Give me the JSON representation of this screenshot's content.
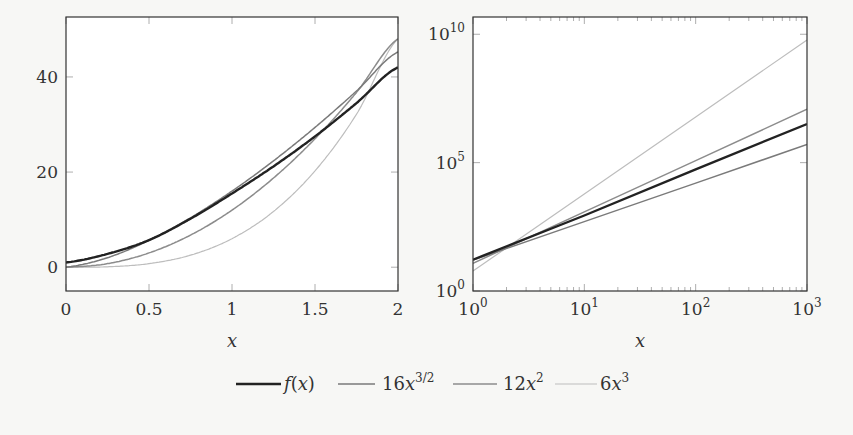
{
  "legend": {
    "entries": [
      {
        "label": "f(x)",
        "label_main": "f",
        "label_rest": "(x)",
        "color": "#222222",
        "width": 2.4
      },
      {
        "label": "16x^{3/2}",
        "coef": "16",
        "var": "x",
        "sup": "3/2",
        "color": "#7a7a7a",
        "width": 1.5
      },
      {
        "label": "12x^2",
        "coef": "12",
        "var": "x",
        "sup": "2",
        "color": "#8c8c8c",
        "width": 1.5
      },
      {
        "label": "6x^3",
        "coef": "6",
        "var": "x",
        "sup": "3",
        "color": "#bdbdbd",
        "width": 1.2
      }
    ]
  },
  "chart_data": [
    {
      "type": "line",
      "title": "",
      "xlabel": "x",
      "ylabel": "",
      "xscale": "linear",
      "yscale": "linear",
      "xlim": [
        0,
        2
      ],
      "ylim": [
        -5,
        52.6
      ],
      "xticks": [
        0,
        0.5,
        1,
        1.5,
        2
      ],
      "xtick_labels": [
        "0",
        "0.5",
        "1",
        "1.5",
        "2"
      ],
      "yticks": [
        0,
        20,
        40
      ],
      "ytick_labels": [
        "0",
        "20",
        "40"
      ],
      "grid": false,
      "legend_position": "bottom-center (shared)",
      "series": [
        {
          "name": "f(x)",
          "x": [
            0,
            0.25,
            0.5,
            0.75,
            1,
            1.25,
            1.5,
            1.75,
            2
          ],
          "values": [
            1,
            2.8,
            5.7,
            10.2,
            15.5,
            21.2,
            27.5,
            34.5,
            42
          ]
        },
        {
          "name": "16x^{3/2}",
          "x": [
            0,
            0.25,
            0.5,
            0.75,
            1,
            1.25,
            1.5,
            1.75,
            2
          ],
          "values": [
            0,
            2,
            5.66,
            10.39,
            16,
            22.36,
            29.39,
            37.04,
            45.25
          ]
        },
        {
          "name": "12x^2",
          "x": [
            0,
            0.25,
            0.5,
            0.75,
            1,
            1.25,
            1.5,
            1.75,
            2
          ],
          "values": [
            0,
            0.75,
            3,
            6.75,
            12,
            18.75,
            27,
            36.75,
            48
          ]
        },
        {
          "name": "6x^3",
          "x": [
            0,
            0.25,
            0.5,
            0.75,
            1,
            1.25,
            1.5,
            1.75,
            2
          ],
          "values": [
            0,
            0.09,
            0.75,
            2.53,
            6,
            11.72,
            20.25,
            32.16,
            48
          ]
        }
      ]
    },
    {
      "type": "line",
      "title": "",
      "xlabel": "x",
      "ylabel": "",
      "xscale": "log",
      "yscale": "log",
      "xlim": [
        1,
        1000
      ],
      "ylim": [
        1,
        47000000000.0
      ],
      "xticks": [
        1,
        10,
        100,
        1000
      ],
      "xtick_labels": [
        "10^0",
        "10^1",
        "10^2",
        "10^3"
      ],
      "yticks": [
        1,
        100000,
        10000000000
      ],
      "ytick_labels": [
        "10^0",
        "10^5",
        "10^10"
      ],
      "grid": false,
      "series": [
        {
          "name": "f(x)",
          "x": [
            1,
            10,
            100,
            1000
          ],
          "values": [
            16.5,
            870,
            55000,
            3200000
          ]
        },
        {
          "name": "16x^{3/2}",
          "x": [
            1,
            10,
            100,
            1000
          ],
          "values": [
            16,
            506,
            16000,
            506000
          ]
        },
        {
          "name": "12x^2",
          "x": [
            1,
            10,
            100,
            1000
          ],
          "values": [
            12,
            1200,
            120000,
            12000000
          ]
        },
        {
          "name": "6x^3",
          "x": [
            1,
            10,
            100,
            1000
          ],
          "values": [
            6,
            6000,
            6000000,
            6000000000
          ]
        }
      ]
    }
  ]
}
